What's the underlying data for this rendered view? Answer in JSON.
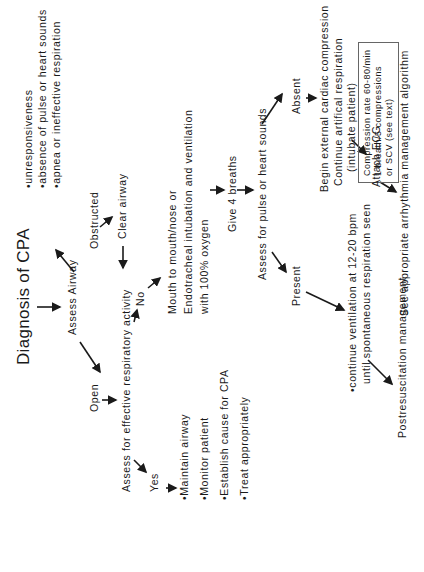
{
  "title": "Diagnosis of CPA",
  "diagnosis_criteria": [
    "•unresponsiveness",
    "•absence of pulse or heart sounds",
    "•apnea or ineffective respiration"
  ],
  "nodes": {
    "assess_airway": "Assess Airway",
    "open": "Open",
    "obstructed": "Obstructed",
    "clear_airway": "Clear airway",
    "assess_respiratory": "Assess for effective respiratory activity",
    "yes": "Yes",
    "no": "No",
    "yes_actions": [
      "•Maintain airway",
      "•Monitor patient",
      "•Establish cause for CPA",
      "•Treat appropriately"
    ],
    "ventilation": [
      "Mouth to mouth/nose  or",
      "Endotracheal intubation and ventilation",
      "with 100% oxygen"
    ],
    "give_breaths": "Give 4 breaths",
    "assess_pulse": "Assess for pulse or heart sounds",
    "present": "Present",
    "absent": "Absent",
    "continue_ventilation": [
      "•continue ventilation at 12-20 bpm",
      "until spontaneous respiration seen"
    ],
    "postresuscitation": "Postresuscitation management",
    "absent_actions": [
      "Begin external cardiac compression",
      "Continue artifical respiration",
      "(intubate patient)"
    ],
    "compression_box": [
      "Compression rate 60-80/min",
      "1 breath/5 compressions",
      "or SCV (see text)"
    ],
    "attach_ecg": "Attach ECG",
    "arrhythmia": "See appropriate arrhythmia management algorithm"
  }
}
